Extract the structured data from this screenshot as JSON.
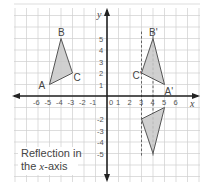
{
  "diagram": {
    "caption_line1": "Reflection in",
    "caption_line2": "the x-axis",
    "caption_prefix": "the ",
    "caption_var": "x",
    "caption_suffix": "-axis",
    "axis_x_label": "x",
    "axis_y_label": "y",
    "x_ticks": [
      "-6",
      "-5",
      "-4",
      "-3",
      "-2",
      "-1",
      "0",
      "1",
      "2",
      "3",
      "4",
      "5",
      "6"
    ],
    "y_ticks_pos": [
      "1",
      "2",
      "3",
      "4",
      "5"
    ],
    "y_ticks_neg": [
      "-1",
      "-2",
      "-3",
      "-4",
      "-5"
    ],
    "triangle_original": {
      "labels": {
        "A": "A",
        "B": "B",
        "C": "C"
      },
      "points": {
        "A": [
          -5,
          1
        ],
        "B": [
          -4,
          5
        ],
        "C": [
          -3,
          2
        ]
      }
    },
    "triangle_reflected_y": {
      "labels": {
        "A": "A'",
        "B": "B'",
        "C": "C'"
      },
      "points": {
        "A": [
          5,
          1
        ],
        "B": [
          4,
          5
        ],
        "C": [
          3,
          2
        ]
      }
    },
    "triangle_reflected_x": {
      "points": {
        "A": [
          5,
          -1
        ],
        "B": [
          4,
          -5
        ],
        "C": [
          3,
          -2
        ]
      }
    },
    "dashed_guides_x": [
      3,
      4
    ],
    "colors": {
      "grid": "#cfcfcf",
      "axis": "#222222",
      "fill": "#c8c8c8",
      "stroke": "#555555"
    }
  }
}
